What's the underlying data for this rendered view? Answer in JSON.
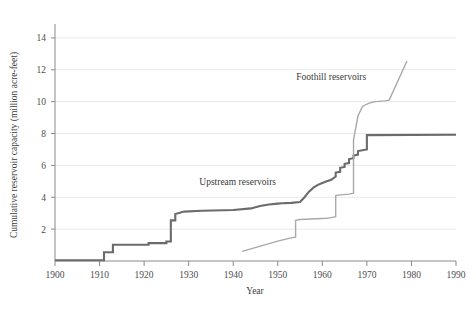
{
  "chart_data": {
    "type": "line",
    "title": "",
    "subtitle": "",
    "xlabel": "Year",
    "ylabel": "Cumulative reservoir capacity (million acre-feet)",
    "xlim": [
      1900,
      1990
    ],
    "ylim": [
      0,
      15
    ],
    "xticks": [
      1900,
      1910,
      1920,
      1930,
      1940,
      1950,
      1960,
      1970,
      1980,
      1990
    ],
    "xtick_labels": [
      "1900",
      "1910",
      "1920",
      "1930",
      "1940",
      "1950",
      "1960",
      "1970",
      "1980",
      "1990"
    ],
    "yticks": [
      2,
      4,
      6,
      8,
      10,
      12,
      14
    ],
    "ytick_labels": [
      "2",
      "4",
      "6",
      "8",
      "10",
      "12",
      "14"
    ],
    "grid": "horizontal-only",
    "legend_position": "inline-annotation",
    "background_color": "#ffffff",
    "grid_color": "#e9e9e9",
    "axis_color": "#8a8a8a",
    "series": [
      {
        "name": "Upstream reservoirs",
        "color": "#6b6b6b",
        "line_width": 2.1,
        "label_x": 1941,
        "label_y": 4.75,
        "points": [
          [
            1900,
            0.05
          ],
          [
            1911,
            0.05
          ],
          [
            1911,
            0.55
          ],
          [
            1913,
            0.55
          ],
          [
            1913,
            1.02
          ],
          [
            1921,
            1.02
          ],
          [
            1921,
            1.12
          ],
          [
            1925,
            1.12
          ],
          [
            1925,
            1.22
          ],
          [
            1926,
            1.22
          ],
          [
            1926,
            2.55
          ],
          [
            1927,
            2.55
          ],
          [
            1927,
            2.95
          ],
          [
            1929,
            3.1
          ],
          [
            1933,
            3.15
          ],
          [
            1940,
            3.2
          ],
          [
            1944,
            3.3
          ],
          [
            1946,
            3.45
          ],
          [
            1948,
            3.55
          ],
          [
            1950,
            3.6
          ],
          [
            1951,
            3.62
          ],
          [
            1953,
            3.65
          ],
          [
            1955,
            3.7
          ],
          [
            1956,
            4.0
          ],
          [
            1957,
            4.35
          ],
          [
            1958,
            4.6
          ],
          [
            1959,
            4.78
          ],
          [
            1960,
            4.9
          ],
          [
            1961,
            5.0
          ],
          [
            1962,
            5.1
          ],
          [
            1963,
            5.3
          ],
          [
            1963,
            5.55
          ],
          [
            1964,
            5.6
          ],
          [
            1964,
            5.85
          ],
          [
            1965,
            5.9
          ],
          [
            1965,
            6.1
          ],
          [
            1966,
            6.15
          ],
          [
            1966,
            6.4
          ],
          [
            1967,
            6.45
          ],
          [
            1967,
            6.62
          ],
          [
            1968,
            6.68
          ],
          [
            1968,
            6.9
          ],
          [
            1969,
            6.95
          ],
          [
            1970,
            7.0
          ],
          [
            1970,
            7.9
          ],
          [
            1990,
            7.92
          ]
        ]
      },
      {
        "name": "Foothill reservoirs",
        "color": "#a9a9a9",
        "line_width": 1.4,
        "label_x": 1962,
        "label_y": 11.35,
        "points": [
          [
            1942,
            0.6
          ],
          [
            1950,
            1.25
          ],
          [
            1953,
            1.45
          ],
          [
            1954,
            1.5
          ],
          [
            1954,
            2.55
          ],
          [
            1955,
            2.6
          ],
          [
            1961,
            2.68
          ],
          [
            1962,
            2.72
          ],
          [
            1963,
            2.78
          ],
          [
            1963,
            4.1
          ],
          [
            1964,
            4.15
          ],
          [
            1966,
            4.2
          ],
          [
            1967,
            4.25
          ],
          [
            1967,
            7.6
          ],
          [
            1968,
            9.1
          ],
          [
            1969,
            9.7
          ],
          [
            1970,
            9.85
          ],
          [
            1971,
            9.95
          ],
          [
            1972,
            10.0
          ],
          [
            1974,
            10.05
          ],
          [
            1975,
            10.1
          ],
          [
            1979,
            12.55
          ]
        ]
      }
    ]
  }
}
